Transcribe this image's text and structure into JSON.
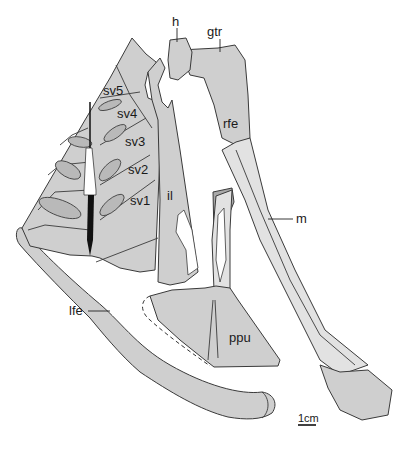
{
  "figure": {
    "type": "anatomical-illustration",
    "colors": {
      "bone": "#cfcfcf",
      "bone_light": "#e2e2e2",
      "bone_dark": "#a9a9a9",
      "outline": "#3a3a3a",
      "background": "#ffffff"
    },
    "labels": {
      "h": "h",
      "gtr": "gtr",
      "sv5": "sv5",
      "sv4": "sv4",
      "sv3": "sv3",
      "sv2": "sv2",
      "sv1": "sv1",
      "il": "il",
      "rfe": "rfe",
      "m": "m",
      "lfe": "lfe",
      "ppu": "ppu"
    },
    "scale_bar": {
      "label": "1cm"
    }
  }
}
